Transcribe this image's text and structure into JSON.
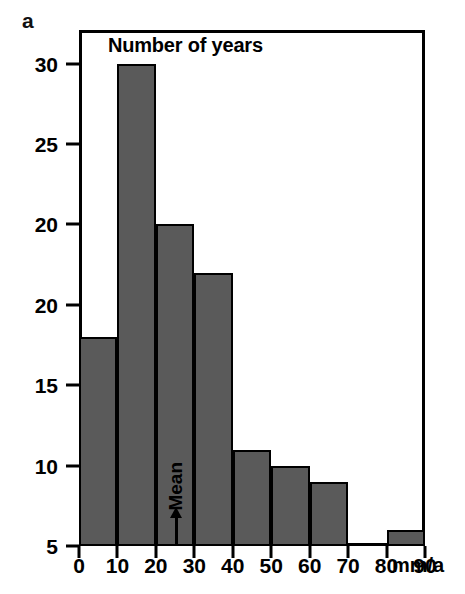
{
  "panel": {
    "label": "a"
  },
  "chart_data": {
    "type": "bar",
    "title": "Number of years",
    "xlabel": "mm/a",
    "ylabel": "Number of years",
    "categories": [
      "0-10",
      "10-20",
      "20-30",
      "30-40",
      "40-50",
      "50-60",
      "60-70",
      "70-80",
      "80-90"
    ],
    "bin_edges": [
      0,
      10,
      20,
      30,
      40,
      50,
      60,
      70,
      80,
      90
    ],
    "values": [
      13,
      30,
      20,
      17,
      6,
      5,
      4,
      0,
      1
    ],
    "xlim": [
      0,
      90
    ],
    "ylim": [
      0,
      31
    ],
    "x_ticks": [
      0,
      10,
      20,
      30,
      40,
      50,
      60,
      70,
      80,
      90
    ],
    "x_tick_labels": [
      "0",
      "10",
      "20",
      "30",
      "40",
      "50",
      "60",
      "70",
      "80",
      "90"
    ],
    "y_ticks": [
      0,
      5,
      10,
      15,
      20,
      25,
      30
    ],
    "y_tick_labels": [
      "30",
      "25",
      "20",
      "20",
      "15",
      "10",
      "5",
      "0"
    ],
    "y_tick_values_top_to_bottom": [
      30,
      25,
      20,
      15,
      10,
      5,
      0
    ],
    "grid": false,
    "legend": null,
    "bar_color": "#5a5a5a",
    "bar_edge_color": "#000000",
    "annotations": [
      {
        "text": "Mean",
        "x": 25,
        "orientation": "vertical",
        "marker": "up-arrow"
      }
    ]
  },
  "axis_unit": {
    "text": "mm/a"
  }
}
